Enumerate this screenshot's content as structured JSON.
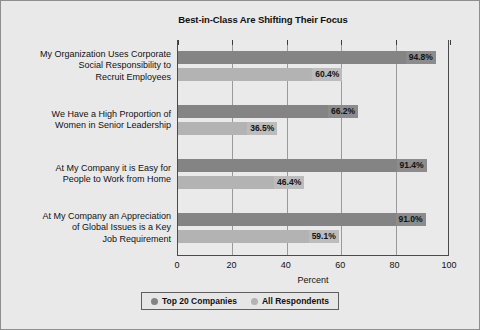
{
  "chart_data": {
    "type": "bar",
    "orientation": "horizontal",
    "title": "Best-in-Class Are Shifting Their Focus",
    "xlabel": "Percent",
    "ylabel": "",
    "xlim": [
      0,
      100
    ],
    "xticks": [
      0,
      20,
      40,
      60,
      80,
      100
    ],
    "xticklabels": [
      "0",
      "20",
      "40",
      "60",
      "80",
      "100"
    ],
    "grid": "vertical",
    "legend_position": "bottom-center",
    "categories": [
      "My Organization Uses Corporate\nSocial Responsibility to\nRecruit Employees",
      "We Have a High Proportion of\nWomen in Senior Leadership",
      "At My Company it is  Easy for\nPeople to Work from Home",
      "At My Company an Appreciation\nof Global Issues is a Key\nJob Requirement"
    ],
    "series": [
      {
        "name": "Top 20 Companies",
        "color": "#848484",
        "values": [
          94.8,
          66.2,
          91.4,
          91.0
        ],
        "labels": [
          "94.8%",
          "66.2%",
          "91.4%",
          "91.0%"
        ]
      },
      {
        "name": "All Respondents",
        "color": "#b3b3b3",
        "values": [
          60.4,
          36.5,
          46.4,
          59.1
        ],
        "labels": [
          "60.4%",
          "36.5%",
          "46.4%",
          "59.1%"
        ]
      }
    ]
  },
  "figure": {
    "background": "#e9e9e9",
    "frame_color": "#8e8e8e",
    "axis_color": "#4a4a4a",
    "gridline_color": "#9a9a9a"
  }
}
